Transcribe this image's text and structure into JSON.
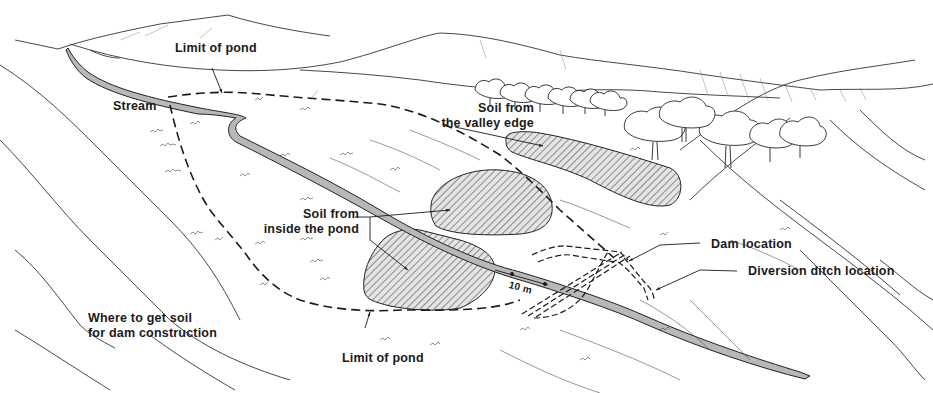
{
  "diagram": {
    "type": "landscape illustration",
    "subject": "Where to get soil for dam construction",
    "colors": {
      "ink": "#1a1a1a",
      "stream_fill": "#b8b8b8",
      "borrow_area_fill": "#d9d9d9",
      "background": "#ffffff"
    },
    "labels": {
      "limit_of_pond_top": "Limit of pond",
      "stream": "Stream",
      "soil_valley_edge_line1": "Soil from",
      "soil_valley_edge_line2": "the valley edge",
      "soil_inside_pond_line1": "Soil from",
      "soil_inside_pond_line2": "inside the pond",
      "dam_location": "Dam location",
      "diversion_ditch_location": "Diversion ditch location",
      "distance": "10 m",
      "caption_line1": "Where to get soil",
      "caption_line2": "for dam construction",
      "limit_of_pond_bottom": "Limit of pond"
    },
    "elements": [
      {
        "name": "hills",
        "description": "rolling hills in background"
      },
      {
        "name": "trees",
        "description": "groups of trees on right side"
      },
      {
        "name": "stream",
        "description": "gray stream running diagonally from upper left to lower right"
      },
      {
        "name": "pond-limit",
        "description": "dashed boundary of future pond"
      },
      {
        "name": "borrow-area-valley-edge",
        "description": "hatched elongated area outside pond"
      },
      {
        "name": "borrow-area-inside-pond-1",
        "description": "hatched area inside pond above stream"
      },
      {
        "name": "borrow-area-inside-pond-2",
        "description": "hatched area inside pond below stream"
      },
      {
        "name": "dam",
        "description": "dashed dam outline across stream"
      },
      {
        "name": "diversion-ditch",
        "description": "dashed diversion ditch"
      }
    ]
  }
}
